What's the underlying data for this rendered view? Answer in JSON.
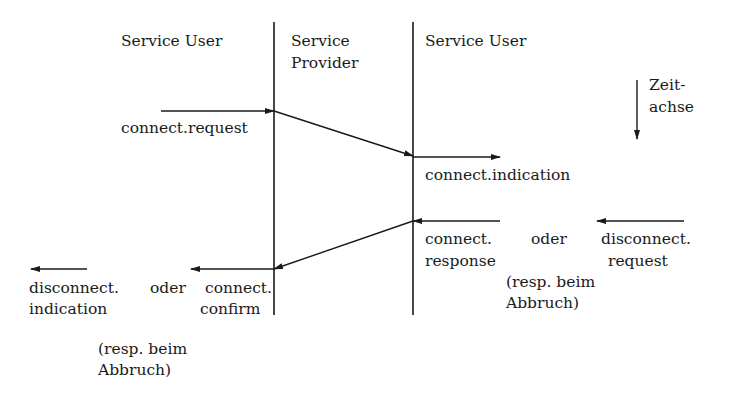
{
  "columns": {
    "left": "Service User",
    "middle_line1": "Service",
    "middle_line2": "Provider",
    "right": "Service User"
  },
  "time_axis": {
    "line1": "Zeit-",
    "line2": "achse"
  },
  "primitives": {
    "connect_request": "connect.request",
    "connect_indication": "connect.indication",
    "response_block": {
      "connect": "connect.",
      "oder": "oder",
      "disconnect": "disconnect.",
      "response": "response",
      "request": "request",
      "note_line1": "(resp. beim",
      "note_line2": "Abbruch)"
    },
    "confirm_block": {
      "disconnect": "disconnect.",
      "oder": "oder",
      "connect": "connect.",
      "indication": "indication",
      "confirm": "confirm",
      "note_line1": "(resp. beim",
      "note_line2": "Abbruch)"
    }
  },
  "colors": {
    "line": "#1a1a1a",
    "background": "#ffffff"
  }
}
